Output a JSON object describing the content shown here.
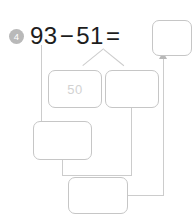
{
  "problem": {
    "number_label": "4",
    "equation": {
      "minuend": "93",
      "operator_minus": "−",
      "subtrahend": "51",
      "operator_equals": "="
    }
  },
  "boxes": {
    "answer": {
      "value": "",
      "placeholder": ""
    },
    "tens_part": {
      "value": "",
      "placeholder": "50"
    },
    "ones_part": {
      "value": "",
      "placeholder": ""
    },
    "middle_step": {
      "value": "",
      "placeholder": ""
    },
    "final_step": {
      "value": "",
      "placeholder": ""
    }
  },
  "colors": {
    "box_border": "#c6c6c6",
    "connector": "#cccccc",
    "badge_background": "#b9b9b9",
    "badge_text": "#ffffff",
    "equation_text": "#1d1d1d",
    "placeholder_text": "#d2d2d2",
    "page_background": "#ffffff"
  }
}
